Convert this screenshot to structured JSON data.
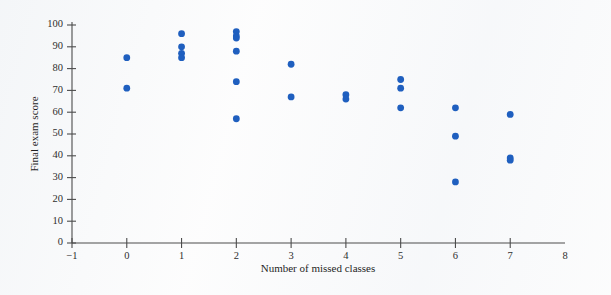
{
  "chart_data": {
    "type": "scatter",
    "title": "",
    "xlabel": "Number of missed classes",
    "ylabel": "Final exam score",
    "xlim": [
      -1,
      8
    ],
    "ylim": [
      0,
      100
    ],
    "xticks": [
      "-1",
      "0",
      "1",
      "2",
      "3",
      "4",
      "5",
      "6",
      "7",
      "8"
    ],
    "xtick_values": [
      -1,
      0,
      1,
      2,
      3,
      4,
      5,
      6,
      7,
      8
    ],
    "yticks": [
      "0",
      "10",
      "20",
      "30",
      "40",
      "50",
      "60",
      "70",
      "80",
      "90",
      "100"
    ],
    "ytick_values": [
      0,
      10,
      20,
      30,
      40,
      50,
      60,
      70,
      80,
      90,
      100
    ],
    "grid": false,
    "legend": null,
    "marker": {
      "shape": "circle",
      "color": "#1f5fbf",
      "radius_px": 3.4
    },
    "n_points": 22,
    "points": [
      {
        "x": 0,
        "y": 85
      },
      {
        "x": 0,
        "y": 71
      },
      {
        "x": 1,
        "y": 96
      },
      {
        "x": 1,
        "y": 90
      },
      {
        "x": 1,
        "y": 87
      },
      {
        "x": 1,
        "y": 85
      },
      {
        "x": 2,
        "y": 97
      },
      {
        "x": 2,
        "y": 95
      },
      {
        "x": 2,
        "y": 94
      },
      {
        "x": 2,
        "y": 88
      },
      {
        "x": 2,
        "y": 74
      },
      {
        "x": 2,
        "y": 57
      },
      {
        "x": 3,
        "y": 82
      },
      {
        "x": 3,
        "y": 67
      },
      {
        "x": 4,
        "y": 68
      },
      {
        "x": 4,
        "y": 66
      },
      {
        "x": 5,
        "y": 75
      },
      {
        "x": 5,
        "y": 71
      },
      {
        "x": 5,
        "y": 62
      },
      {
        "x": 6,
        "y": 62
      },
      {
        "x": 6,
        "y": 49
      },
      {
        "x": 6,
        "y": 28
      },
      {
        "x": 7,
        "y": 59
      },
      {
        "x": 7,
        "y": 39
      },
      {
        "x": 7,
        "y": 38
      }
    ]
  },
  "colors": {
    "marker": "#1f5fbf",
    "axis": "#4c4c4c",
    "text": "#1f1f1f",
    "background": "#fdfdfd"
  }
}
